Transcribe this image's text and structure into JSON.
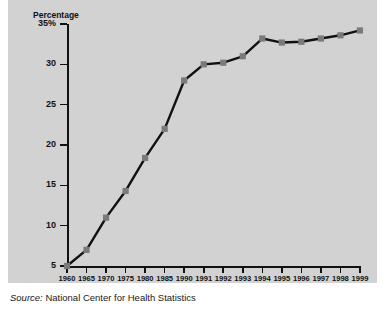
{
  "chart_data": {
    "type": "line",
    "title": "U.S. Children Born to Unwed Mothers",
    "ylabel": "Percentage",
    "xlabel": "",
    "ylim": [
      5,
      35
    ],
    "yticks": [
      35,
      30,
      25,
      20,
      15,
      10,
      5
    ],
    "ytick_labels": [
      "35%",
      "30",
      "25",
      "20",
      "15",
      "10",
      "5"
    ],
    "grid": false,
    "legend": null,
    "categories": [
      "1960",
      "1965",
      "1970",
      "1975",
      "1980",
      "1985",
      "1990",
      "1991",
      "1992",
      "1993",
      "1994",
      "1995",
      "1996",
      "1997",
      "1998",
      "1999"
    ],
    "values": [
      5,
      7,
      11,
      14.3,
      18.4,
      22,
      28,
      30,
      30.2,
      31,
      33.2,
      32.7,
      32.8,
      33.2,
      33.6,
      34.2
    ],
    "marker": "square",
    "line_color": "#111111",
    "marker_color": "#7a7a7a",
    "plot_background": "#d2d2d2",
    "source_label": "Source:",
    "source_text": "National Center for Health Statistics"
  }
}
